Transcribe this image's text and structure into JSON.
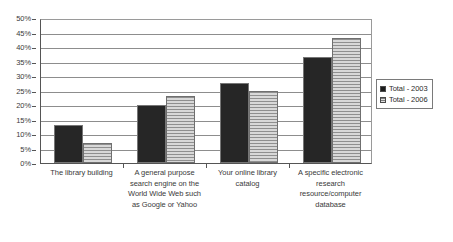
{
  "chart_data": {
    "type": "bar",
    "title": "",
    "subtitle": "",
    "xlabel": "",
    "ylabel": "",
    "ylim": [
      0,
      50
    ],
    "ytick_labels": [
      "0%",
      "5%",
      "10%",
      "15%",
      "20%",
      "25%",
      "30%",
      "35%",
      "40%",
      "45%",
      "50%"
    ],
    "ytick_values": [
      0,
      5,
      10,
      15,
      20,
      25,
      30,
      35,
      40,
      45,
      50
    ],
    "grid": "horizontal",
    "legend_position": "right",
    "categories": [
      "The library building",
      "A general purpose search engine on the World Wide Web such as Google or Yahoo",
      "Your online library catalog",
      "A specific electronic research resource/computer database"
    ],
    "series": [
      {
        "name": "Total - 2003",
        "fill": "solid",
        "color": "#262626",
        "values": [
          13,
          20,
          27.5,
          36.5
        ]
      },
      {
        "name": "Total - 2006",
        "fill": "horizontal-stripes",
        "color": "#8f8f8f",
        "values": [
          7,
          23,
          25,
          43
        ]
      }
    ]
  },
  "legend": {
    "entries": [
      {
        "label": "Total - 2003"
      },
      {
        "label": "Total - 2006"
      }
    ]
  }
}
